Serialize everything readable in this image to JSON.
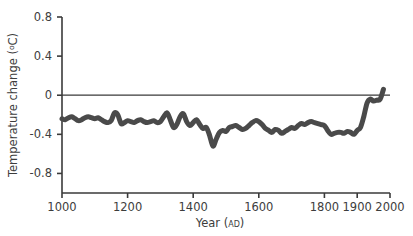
{
  "chart_data": {
    "type": "line",
    "title": "",
    "xlabel": "Year (AD)",
    "xlabel_main": "Year (",
    "xlabel_small": "AD",
    "xlabel_close": ")",
    "ylabel": "Temperature change (°C)",
    "ylabel_main": "Temperature change (",
    "ylabel_sup": "o",
    "ylabel_unit": "C)",
    "xlim": [
      1000,
      2000
    ],
    "ylim": [
      -1.0,
      0.8
    ],
    "grid": false,
    "legend": "none",
    "line_color": "#4a4a4a",
    "zero_line_color": "#3a3a3a",
    "axis_color": "#3a3a3a",
    "line_width_px": 5,
    "xticks": [
      1000,
      1200,
      1400,
      1600,
      1800,
      1900,
      2000
    ],
    "xtick_labels": [
      "1000",
      "1200",
      "1400",
      "1600",
      "1800",
      "1900",
      "2000"
    ],
    "yticks": [
      0.8,
      0.4,
      0,
      -0.4,
      -0.8
    ],
    "ytick_labels": [
      "0.8",
      "0.4",
      "0",
      "-0.4",
      "-0.8"
    ],
    "zero_reference": 0,
    "series": [
      {
        "name": "Northern Hemisphere temperature anomaly",
        "x": [
          1000,
          1010,
          1020,
          1030,
          1040,
          1050,
          1060,
          1070,
          1080,
          1090,
          1100,
          1110,
          1120,
          1130,
          1140,
          1150,
          1160,
          1170,
          1180,
          1190,
          1200,
          1210,
          1220,
          1230,
          1240,
          1250,
          1260,
          1270,
          1280,
          1290,
          1300,
          1310,
          1320,
          1330,
          1340,
          1350,
          1360,
          1370,
          1380,
          1390,
          1400,
          1410,
          1420,
          1430,
          1440,
          1450,
          1460,
          1470,
          1480,
          1490,
          1500,
          1510,
          1520,
          1530,
          1540,
          1550,
          1560,
          1570,
          1580,
          1590,
          1600,
          1610,
          1620,
          1630,
          1640,
          1650,
          1660,
          1670,
          1680,
          1690,
          1700,
          1710,
          1720,
          1730,
          1740,
          1750,
          1760,
          1770,
          1780,
          1790,
          1800,
          1810,
          1820,
          1830,
          1840,
          1850,
          1860,
          1870,
          1880,
          1890,
          1900,
          1910,
          1920,
          1930,
          1940,
          1950,
          1960,
          1970,
          1980
        ],
        "values": [
          -0.24,
          -0.25,
          -0.23,
          -0.22,
          -0.24,
          -0.26,
          -0.25,
          -0.23,
          -0.22,
          -0.23,
          -0.24,
          -0.23,
          -0.25,
          -0.27,
          -0.28,
          -0.26,
          -0.18,
          -0.2,
          -0.29,
          -0.28,
          -0.26,
          -0.27,
          -0.28,
          -0.26,
          -0.25,
          -0.27,
          -0.28,
          -0.27,
          -0.26,
          -0.28,
          -0.27,
          -0.22,
          -0.18,
          -0.25,
          -0.33,
          -0.3,
          -0.22,
          -0.19,
          -0.27,
          -0.31,
          -0.28,
          -0.25,
          -0.3,
          -0.34,
          -0.33,
          -0.41,
          -0.52,
          -0.45,
          -0.38,
          -0.36,
          -0.37,
          -0.33,
          -0.32,
          -0.31,
          -0.33,
          -0.35,
          -0.34,
          -0.31,
          -0.28,
          -0.26,
          -0.27,
          -0.3,
          -0.34,
          -0.36,
          -0.38,
          -0.35,
          -0.36,
          -0.39,
          -0.37,
          -0.35,
          -0.33,
          -0.34,
          -0.31,
          -0.29,
          -0.3,
          -0.28,
          -0.27,
          -0.28,
          -0.29,
          -0.3,
          -0.31,
          -0.36,
          -0.4,
          -0.39,
          -0.38,
          -0.38,
          -0.39,
          -0.37,
          -0.38,
          -0.4,
          -0.36,
          -0.33,
          -0.22,
          -0.08,
          -0.04,
          -0.06,
          -0.05,
          -0.04,
          0.06
        ]
      }
    ]
  }
}
